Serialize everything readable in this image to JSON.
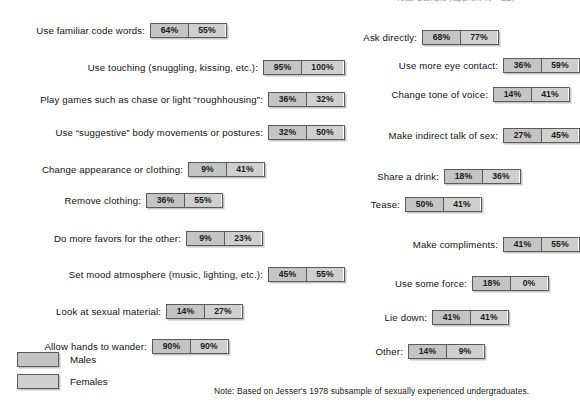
{
  "header": {
    "clipped_text": "Total Sample (approx. N = 22)"
  },
  "legend": {
    "items": [
      {
        "label": "Males",
        "color": "#c4c4c4"
      },
      {
        "label": "Females",
        "color": "#cfcfcf"
      }
    ]
  },
  "note": "Note: Based on Jesser's 1978 subsample of sexually experienced undergraduates.",
  "chart_data": {
    "type": "bar",
    "title": "",
    "subtitle": "",
    "xlabel": "",
    "ylabel": "",
    "grid": false,
    "legend_position": "bottom-left",
    "value_unit": "%",
    "series": [
      {
        "name": "Males",
        "color": "#c4c4c4"
      },
      {
        "name": "Females",
        "color": "#cfcfcf"
      }
    ],
    "columns": [
      {
        "name": "left",
        "categories": [
          "Use familiar code words:",
          "Use touching (snuggling, kissing, etc.):",
          "Play games such as chase or light “roughhousing”:",
          "Use “suggestive” body movements or postures:",
          "Change appearance or clothing:",
          "Remove clothing:",
          "Do more favors for the other:",
          "Set mood atmosphere (music, lighting, etc.):",
          "Look at sexual material:",
          "Allow hands to wander:"
        ],
        "males": [
          64,
          95,
          36,
          32,
          9,
          36,
          9,
          45,
          14,
          90
        ],
        "females": [
          55,
          100,
          32,
          50,
          41,
          55,
          23,
          55,
          27,
          90
        ],
        "males_labels": [
          "64%",
          "95%",
          "36%",
          "32%",
          "9%",
          "36%",
          "9%",
          "45%",
          "14%",
          "90%"
        ],
        "females_labels": [
          "55%",
          "100%",
          "32%",
          "50%",
          "41%",
          "55%",
          "23%",
          "55%",
          "27%",
          "90%"
        ]
      },
      {
        "name": "right",
        "categories": [
          "Ask directly:",
          "Use more eye contact:",
          "Change tone of voice:",
          "Make indirect talk of sex:",
          "Share a drink:",
          "Tease:",
          "Make compliments:",
          "Use some force:",
          "Lie down:",
          "Other:"
        ],
        "males": [
          68,
          36,
          14,
          27,
          18,
          50,
          41,
          18,
          41,
          14
        ],
        "females": [
          77,
          59,
          41,
          45,
          36,
          41,
          55,
          0,
          41,
          9
        ],
        "males_labels": [
          "68%",
          "36%",
          "14%",
          "27%",
          "18%",
          "50%",
          "41%",
          "18%",
          "41%",
          "14%"
        ],
        "females_labels": [
          "77%",
          "59%",
          "41%",
          "45%",
          "36%",
          "41%",
          "55%",
          "0%",
          "41%",
          "9%"
        ]
      }
    ]
  }
}
